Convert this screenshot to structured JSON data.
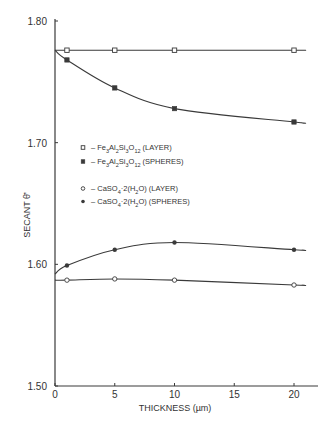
{
  "chart_data": {
    "type": "line",
    "title": "",
    "xlabel": "THICKNESS (µm)",
    "ylabel": "SECANT θ̄'",
    "xlim": [
      0,
      22
    ],
    "ylim": [
      1.5,
      1.8
    ],
    "x_ticks": [
      0,
      5,
      10,
      15,
      20
    ],
    "x_tick_labels": [
      "0",
      "5",
      "10",
      "15",
      "20"
    ],
    "y_ticks": [
      1.5,
      1.6,
      1.7,
      1.8
    ],
    "y_tick_labels": [
      "1.50",
      "1.60",
      "1.70",
      "1.80"
    ],
    "grid": false,
    "legend_position": "inside-left-middle",
    "x": [
      1,
      5,
      10,
      20
    ],
    "series": [
      {
        "name": "Fe3Al2Si3O12 (LAYER)",
        "marker": "open-square",
        "curve_start": 1.776,
        "values": [
          1.776,
          1.776,
          1.776,
          1.776
        ]
      },
      {
        "name": "Fe3Al2Si3O12 (SPHERES)",
        "marker": "filled-square",
        "curve_start": 1.776,
        "values": [
          1.768,
          1.745,
          1.728,
          1.717
        ]
      },
      {
        "name": "CaSO4·2(H2O) (LAYER)",
        "marker": "open-circle",
        "curve_start": 1.587,
        "values": [
          1.587,
          1.588,
          1.587,
          1.583
        ]
      },
      {
        "name": "CaSO4·2(H2O) (SPHERES)",
        "marker": "filled-circle",
        "curve_start": 1.592,
        "values": [
          1.599,
          1.612,
          1.618,
          1.612
        ]
      }
    ]
  },
  "legend": {
    "items": [
      {
        "marker": "open-square",
        "dash": "–",
        "formula_parts": [
          "Fe",
          "3",
          "Al",
          "2",
          "Si",
          "3",
          "O",
          "12"
        ],
        "tag": "(LAYER)"
      },
      {
        "marker": "filled-square",
        "dash": "–",
        "formula_parts": [
          "Fe",
          "3",
          "Al",
          "2",
          "Si",
          "3",
          "O",
          "12"
        ],
        "tag": "(SPHERES)"
      },
      {
        "marker": "open-circle",
        "dash": "–",
        "formula_parts": [
          "CaSO",
          "4",
          "·2(H",
          "2",
          "O)"
        ],
        "tag": "(LAYER)"
      },
      {
        "marker": "filled-circle",
        "dash": "–",
        "formula_parts": [
          "CaSO",
          "4",
          "·2(H",
          "2",
          "O)"
        ],
        "tag": "(SPHERES)"
      }
    ]
  },
  "axes": {
    "x_title": "THICKNESS (µm)",
    "y_title": "SECANT θ̄'"
  }
}
